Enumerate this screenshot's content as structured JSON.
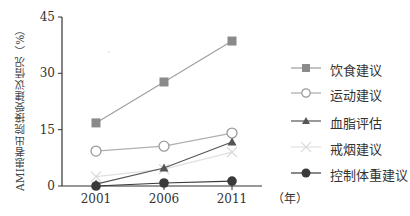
{
  "chart_data": {
    "type": "line",
    "title": "",
    "xlabel": "（年）",
    "ylabel": "AMI患者出院接受建议情况（%）",
    "categories": [
      "2001",
      "2006",
      "2011"
    ],
    "yticks": [
      0,
      15,
      30,
      45
    ],
    "ylim": [
      0,
      45
    ],
    "grid": false,
    "legend_position": "right",
    "series": [
      {
        "name": "饮食建议",
        "marker": "square-filled",
        "color": "#8a8a8a",
        "values": [
          16.8,
          27.7,
          38.6
        ]
      },
      {
        "name": "运动建议",
        "marker": "circle-open",
        "color": "#9a9a9a",
        "values": [
          9.3,
          10.6,
          14.1
        ]
      },
      {
        "name": "血脂评估",
        "marker": "triangle-filled",
        "color": "#555555",
        "values": [
          0.5,
          4.8,
          11.7
        ]
      },
      {
        "name": "戒烟建议",
        "marker": "x",
        "color": "#d8d8d8",
        "values": [
          2.5,
          4.5,
          9.0
        ]
      },
      {
        "name": "控制体重建议",
        "marker": "circle-filled",
        "color": "#3a3a3a",
        "values": [
          0.0,
          0.8,
          1.3
        ]
      }
    ]
  },
  "axis": {
    "y_ticks": [
      "0",
      "15",
      "30",
      "45"
    ],
    "x_ticks": [
      "2001",
      "2006",
      "2011"
    ],
    "x_unit": "（年）",
    "y_title": "AMI患者出院接受建议情况（%）"
  },
  "legend": [
    {
      "label": "饮食建议"
    },
    {
      "label": "运动建议"
    },
    {
      "label": "血脂评估"
    },
    {
      "label": "戒烟建议"
    },
    {
      "label": "控制体重建议"
    }
  ]
}
